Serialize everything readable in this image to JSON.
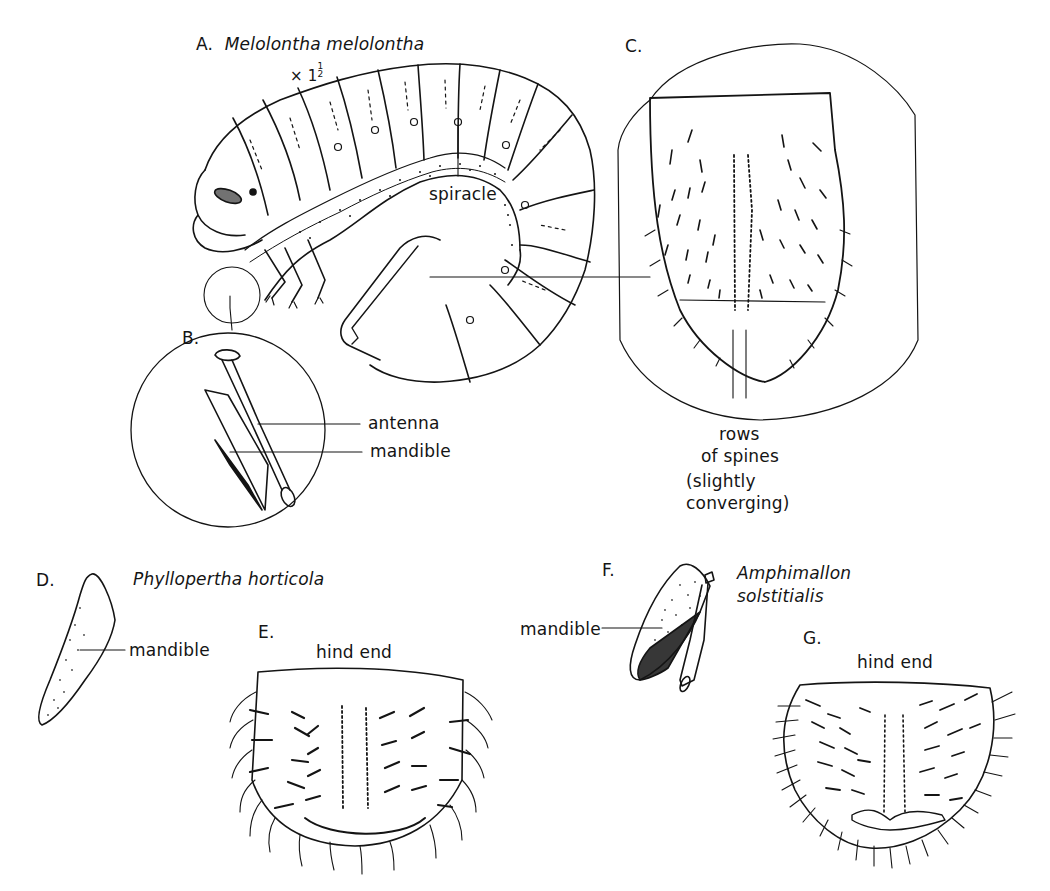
{
  "page": {
    "page_number": "128",
    "background": "#ffffff",
    "ink_color": "#141414"
  },
  "panels": {
    "A": {
      "letter": "A.",
      "species": "Melolontha melolontha",
      "magnification_prefix": "× 1",
      "magnification_num": "1",
      "magnification_den": "2",
      "labels": {
        "spiracle": "spiracle"
      }
    },
    "B": {
      "letter": "B.",
      "labels": {
        "antenna": "antenna",
        "mandible": "mandible"
      }
    },
    "C": {
      "letter": "C.",
      "caption_lines": [
        "rows",
        "of spines",
        "(slightly",
        "converging)"
      ]
    },
    "D": {
      "letter": "D.",
      "species": "Phyllopertha horticola",
      "labels": {
        "mandible": "mandible"
      }
    },
    "E": {
      "letter": "E.",
      "title": "hind end"
    },
    "F": {
      "letter": "F.",
      "species_line1": "Amphimallon",
      "species_line2": "solstitialis",
      "labels": {
        "mandible": "mandible"
      }
    },
    "G": {
      "letter": "G.",
      "title": "hind end"
    }
  }
}
